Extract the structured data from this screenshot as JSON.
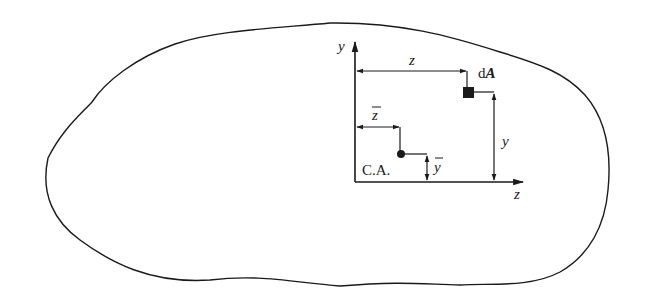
{
  "figure": {
    "colors": {
      "stroke": "#1a1a1a",
      "background": "#ffffff"
    }
  },
  "axes": {
    "vertical_label": "y",
    "horizontal_label": "z"
  },
  "dimensions": {
    "z_distance_label": "z",
    "y_distance_label": "y",
    "zbar_label": "z",
    "ybar_label": "y",
    "bar_symbol": "‾"
  },
  "points": {
    "element_label_d": "d",
    "element_label_A": "A",
    "centroid_label": "C.A."
  }
}
